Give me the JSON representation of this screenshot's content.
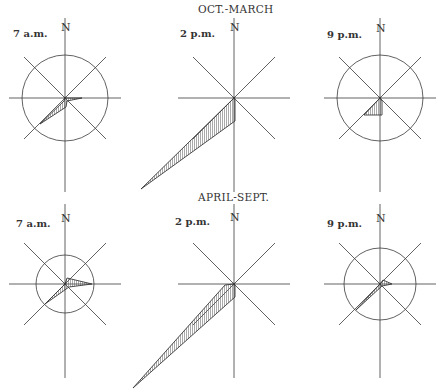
{
  "figure": {
    "rows": [
      {
        "season": "OCT.-MARCH",
        "roses": [
          {
            "time": "7 a.m.",
            "north": "N",
            "cx": 65,
            "cy": 98,
            "circle_r": 43,
            "shape": [
              [
                0,
                0
              ],
              [
                17,
                0
              ],
              [
                2,
                3
              ],
              [
                1,
                9
              ],
              [
                -25,
                26
              ],
              [
                -1,
                3
              ]
            ]
          },
          {
            "time": "2 p.m.",
            "north": "N",
            "cx": 234,
            "cy": 98,
            "circle_r": 0,
            "shape": [
              [
                0,
                0
              ],
              [
                1,
                2
              ],
              [
                1,
                23
              ],
              [
                -93,
                91
              ]
            ]
          },
          {
            "time": "9 p.m.",
            "north": "N",
            "cx": 380,
            "cy": 98,
            "circle_r": 43,
            "shape": [
              [
                0,
                0
              ],
              [
                2,
                3
              ],
              [
                2,
                17
              ],
              [
                -16,
                17
              ]
            ]
          }
        ]
      },
      {
        "season": "APRIL-SEPT.",
        "roses": [
          {
            "time": "7 a.m.",
            "north": "N",
            "cx": 65,
            "cy": 284,
            "circle_r": 29,
            "shape": [
              [
                0,
                0
              ],
              [
                2,
                -6
              ],
              [
                27,
                0
              ],
              [
                4,
                3
              ],
              [
                -20,
                20
              ]
            ]
          },
          {
            "time": "2 p.m.",
            "north": "N",
            "cx": 234,
            "cy": 284,
            "circle_r": 0,
            "shape": [
              [
                0,
                0
              ],
              [
                1,
                2
              ],
              [
                1,
                13
              ],
              [
                -101,
                104
              ],
              [
                -9,
                1
              ]
            ]
          },
          {
            "time": "9 p.m.",
            "north": "N",
            "cx": 380,
            "cy": 284,
            "circle_r": 36,
            "shape": [
              [
                0,
                0
              ],
              [
                3,
                -4
              ],
              [
                12,
                0
              ],
              [
                2,
                2
              ],
              [
                -24,
                26
              ]
            ]
          }
        ]
      }
    ],
    "colors": {
      "ink": "#3a3a3a",
      "hatch": "#555555",
      "background": "#ffffff"
    }
  }
}
